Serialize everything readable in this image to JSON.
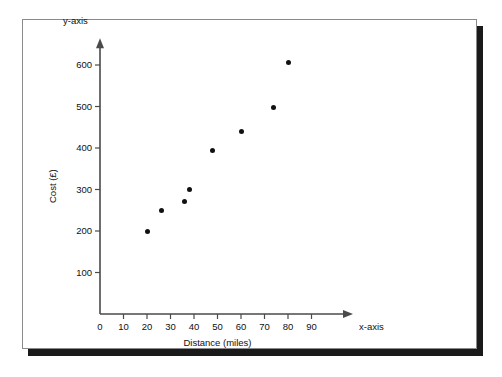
{
  "chart_data": {
    "type": "scatter",
    "title": "",
    "xlabel": "Distance (miles)",
    "ylabel": "Cost (£)",
    "x_axis_name": "x-axis",
    "y_axis_name": "y-axis",
    "xlim": [
      0,
      100
    ],
    "ylim": [
      0,
      650
    ],
    "grid": false,
    "legend": null,
    "x_ticks": [
      0,
      10,
      20,
      30,
      40,
      50,
      60,
      70,
      80,
      90
    ],
    "x_tick_labels": [
      "0",
      "10",
      "20",
      "30",
      "40",
      "50",
      "60",
      "70",
      "80",
      "90"
    ],
    "y_ticks": [
      100,
      200,
      300,
      400,
      500,
      600
    ],
    "y_tick_labels": [
      "100",
      "200",
      "300",
      "400",
      "500",
      "600"
    ],
    "points": [
      {
        "x": 20,
        "y": 200
      },
      {
        "x": 26,
        "y": 250
      },
      {
        "x": 36,
        "y": 272
      },
      {
        "x": 38,
        "y": 300
      },
      {
        "x": 48,
        "y": 394
      },
      {
        "x": 60,
        "y": 440
      },
      {
        "x": 74,
        "y": 498
      },
      {
        "x": 80,
        "y": 605
      }
    ],
    "marker": {
      "shape": "circle",
      "color": "#111111",
      "size": 5
    },
    "axis_color": "#4a4a4a"
  },
  "frame": {
    "border_color": "#8a8a8a",
    "shadow_color": "#1a1a1a",
    "background": "#ffffff"
  }
}
